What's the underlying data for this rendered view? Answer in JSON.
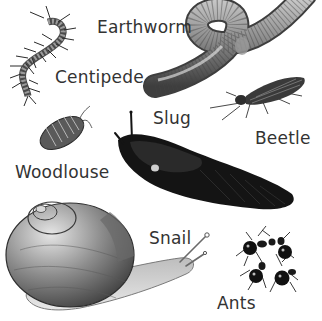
{
  "diagram": {
    "background": "#ffffff",
    "label_color": "#333333",
    "animals": [
      {
        "id": "earthworm",
        "label": "Earthworm",
        "label_pos": [
          97,
          19
        ]
      },
      {
        "id": "centipede",
        "label": "Centipede",
        "label_pos": [
          55,
          69
        ]
      },
      {
        "id": "slug",
        "label": "Slug",
        "label_pos": [
          153,
          110
        ]
      },
      {
        "id": "beetle",
        "label": "Beetle",
        "label_pos": [
          255,
          130
        ]
      },
      {
        "id": "woodlouse",
        "label": "Woodlouse",
        "label_pos": [
          15,
          164
        ]
      },
      {
        "id": "snail",
        "label": "Snail",
        "label_pos": [
          149,
          230
        ]
      },
      {
        "id": "ants",
        "label": "Ants",
        "label_pos": [
          217,
          295
        ]
      }
    ]
  }
}
